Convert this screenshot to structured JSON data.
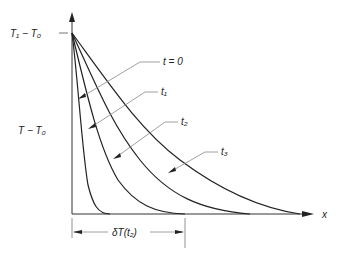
{
  "diagram": {
    "y_axis": {
      "top_label": "T₁ − T₀",
      "label": "T − T₀"
    },
    "x_axis": {
      "label": "x"
    },
    "curves": [
      {
        "label": "t = 0",
        "t_symbol": "t",
        "t_text": " = 0"
      },
      {
        "label": "t₁",
        "t_symbol": "t",
        "t_sub": "1"
      },
      {
        "label": "t₂",
        "t_symbol": "t",
        "t_sub": "2"
      },
      {
        "label": "t₃",
        "t_symbol": "t",
        "t_sub": "3"
      }
    ],
    "dimension": {
      "label": "δT(t₂)",
      "delta": "δ",
      "delta_sub": "T",
      "arg": "(t₂)"
    },
    "colors": {
      "curve": "#222222",
      "leader": "#888888",
      "axis": "#333333"
    }
  }
}
